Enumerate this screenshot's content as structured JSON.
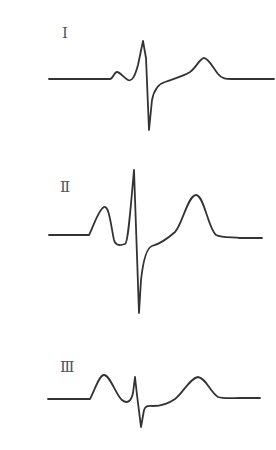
{
  "diagram": {
    "title": "",
    "stroke_color": "#333333",
    "label_color": "#555555",
    "background": "#ffffff",
    "leads": [
      {
        "label": "Ⅰ",
        "label_pos": [
          62,
          26
        ],
        "baseline_y": 79,
        "path": "M49,79 L110,79 C113,79 114,72 117,72 C120,72 124,78 128,80 C132,82 135,76 138,65 L143,41 L146,58 L149,130 L152,100 C154,90 158,84 165,82 C172,79 182,77 190,72 C196,68 200,58 204,58 C208,58 212,66 218,74 C222,79 226,79 232,79 L274,79"
      },
      {
        "label": "Ⅱ",
        "label_pos": [
          60,
          180
        ],
        "baseline_y": 236,
        "path": "M49,235 L89,235 C93,228 98,210 104,207 C109,205 111,226 114,240 C116,247 122,245 125,244 C128,243 130,215 134,170 L139,313 L141,280 C143,262 146,248 152,246 C160,244 166,240 175,232 C182,225 188,195 196,195 C204,195 208,228 216,235 C222,238 232,237 240,238 L262,238"
      },
      {
        "label": "Ⅲ",
        "label_pos": [
          60,
          360
        ],
        "baseline_y": 399,
        "path": "M48,399 L90,399 C94,392 99,375 104,375 C110,375 116,395 122,400 C127,404 131,402 133,393 L135,377 L137,395 L141,427 L144,410 C146,405 148,406 153,406 C160,406 168,404 175,399 C183,393 190,378 198,377 C206,378 210,392 218,397 C224,399 232,398 240,398 L260,398"
      }
    ]
  }
}
